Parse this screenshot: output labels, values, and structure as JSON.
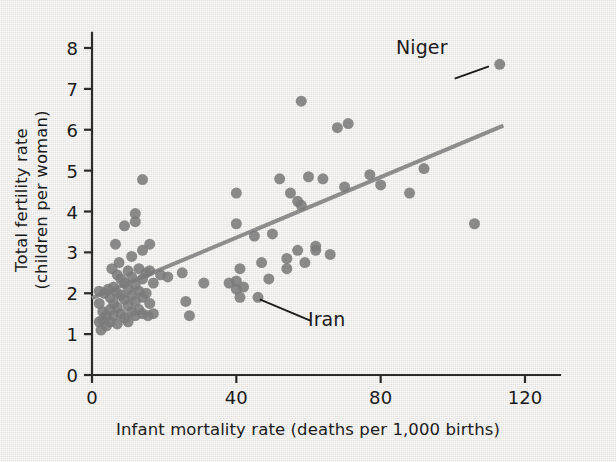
{
  "chart_data": {
    "type": "scatter",
    "title": "",
    "xlabel": "Infant mortality rate (deaths per 1,000 births)",
    "ylabel_line1": "Total fertility rate",
    "ylabel_line2": "(children per woman)",
    "xlim": [
      0,
      130
    ],
    "ylim": [
      0,
      8.4
    ],
    "xticks": [
      0,
      40,
      80,
      120
    ],
    "xtick_labels": [
      "0",
      "40",
      "80",
      "120"
    ],
    "yticks": [
      0,
      1,
      2,
      3,
      4,
      5,
      6,
      7,
      8
    ],
    "ytick_labels": [
      "0",
      "1",
      "2",
      "3",
      "4",
      "5",
      "6",
      "7",
      "8"
    ],
    "grid": false,
    "legend": null,
    "marker_color": "#7b7b7b",
    "marker_size_px": 11,
    "axis_color": "#2a2a2a",
    "background_color": "#eceae6",
    "points": [
      [
        2,
        2.05
      ],
      [
        2,
        1.75
      ],
      [
        2,
        1.3
      ],
      [
        2.5,
        1.1
      ],
      [
        3,
        1.55
      ],
      [
        3,
        1.35
      ],
      [
        3.5,
        2.0
      ],
      [
        4,
        1.45
      ],
      [
        4,
        1.2
      ],
      [
        4.5,
        2.1
      ],
      [
        5,
        1.9
      ],
      [
        5,
        1.6
      ],
      [
        5,
        1.3
      ],
      [
        5.5,
        2.6
      ],
      [
        6,
        2.15
      ],
      [
        6,
        1.75
      ],
      [
        6,
        1.45
      ],
      [
        6.5,
        3.2
      ],
      [
        7,
        2.45
      ],
      [
        7,
        2.0
      ],
      [
        7,
        1.65
      ],
      [
        7,
        1.25
      ],
      [
        7.5,
        2.75
      ],
      [
        8,
        2.35
      ],
      [
        8,
        1.95
      ],
      [
        8,
        1.5
      ],
      [
        9,
        3.65
      ],
      [
        9,
        2.25
      ],
      [
        9,
        1.85
      ],
      [
        9,
        1.4
      ],
      [
        10,
        2.55
      ],
      [
        10,
        2.1
      ],
      [
        10,
        1.7
      ],
      [
        10,
        1.3
      ],
      [
        11,
        2.9
      ],
      [
        11,
        2.4
      ],
      [
        11,
        1.95
      ],
      [
        11,
        1.55
      ],
      [
        12,
        3.95
      ],
      [
        12,
        3.75
      ],
      [
        12,
        2.2
      ],
      [
        12,
        1.8
      ],
      [
        12,
        1.45
      ],
      [
        13,
        2.6
      ],
      [
        13,
        2.05
      ],
      [
        13,
        1.6
      ],
      [
        14,
        4.78
      ],
      [
        14,
        3.05
      ],
      [
        14,
        2.35
      ],
      [
        14,
        1.9
      ],
      [
        14,
        1.5
      ],
      [
        15,
        2.5
      ],
      [
        15,
        2.0
      ],
      [
        15.5,
        1.45
      ],
      [
        16,
        3.2
      ],
      [
        16,
        2.55
      ],
      [
        16,
        1.75
      ],
      [
        17,
        2.25
      ],
      [
        17,
        1.5
      ],
      [
        19,
        2.45
      ],
      [
        21,
        2.4
      ],
      [
        25,
        2.5
      ],
      [
        26,
        1.8
      ],
      [
        27,
        1.45
      ],
      [
        31,
        2.25
      ],
      [
        38,
        2.25
      ],
      [
        40,
        4.45
      ],
      [
        40,
        3.7
      ],
      [
        40,
        2.3
      ],
      [
        40,
        2.1
      ],
      [
        41,
        2.6
      ],
      [
        41,
        1.9
      ],
      [
        42,
        2.15
      ],
      [
        45,
        3.4
      ],
      [
        46,
        1.9
      ],
      [
        47,
        2.75
      ],
      [
        49,
        2.35
      ],
      [
        50,
        3.45
      ],
      [
        52,
        4.8
      ],
      [
        54,
        2.85
      ],
      [
        54,
        2.6
      ],
      [
        55,
        4.45
      ],
      [
        57,
        4.25
      ],
      [
        57,
        3.05
      ],
      [
        58,
        6.7
      ],
      [
        58,
        4.15
      ],
      [
        59,
        2.75
      ],
      [
        60,
        4.85
      ],
      [
        62,
        3.15
      ],
      [
        62,
        3.05
      ],
      [
        64,
        4.8
      ],
      [
        66,
        2.95
      ],
      [
        68,
        6.05
      ],
      [
        70,
        4.6
      ],
      [
        71,
        6.15
      ],
      [
        77,
        4.9
      ],
      [
        80,
        4.65
      ],
      [
        88,
        4.45
      ],
      [
        92,
        5.05
      ],
      [
        106,
        3.7
      ],
      [
        113,
        7.6
      ]
    ],
    "trendline": {
      "label": "linear fit",
      "color": "#8d8d8d",
      "width_px": 4,
      "x0": 0,
      "y0": 1.88,
      "x1": 114,
      "y1": 6.1
    },
    "annotations": [
      {
        "id": "niger",
        "label": "Niger",
        "point": [
          113,
          7.6
        ],
        "leader_from": [
          100.5,
          7.25
        ],
        "leader_to": [
          110.0,
          7.55
        ]
      },
      {
        "id": "iran",
        "label": "Iran",
        "point": [
          46,
          1.9
        ],
        "leader_from": [
          60.5,
          1.33
        ],
        "leader_to": [
          46.5,
          1.85
        ]
      }
    ]
  }
}
